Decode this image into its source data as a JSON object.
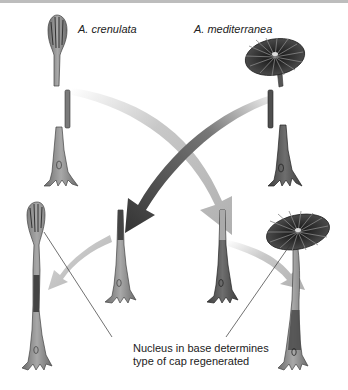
{
  "figure": {
    "species_left": "A. crenulata",
    "species_right": "A. mediterranea",
    "caption_line1": "Nucleus in base determines",
    "caption_line2": "type of cap regenerated"
  },
  "colors": {
    "background": "#ffffff",
    "organism_fill": "#8a8a8a",
    "organism_dark": "#4a4a4a",
    "cap_dark": "#333333",
    "arrow_light": "#bfbfbf",
    "arrow_dark": "#3d3d3d",
    "text": "#222222"
  }
}
